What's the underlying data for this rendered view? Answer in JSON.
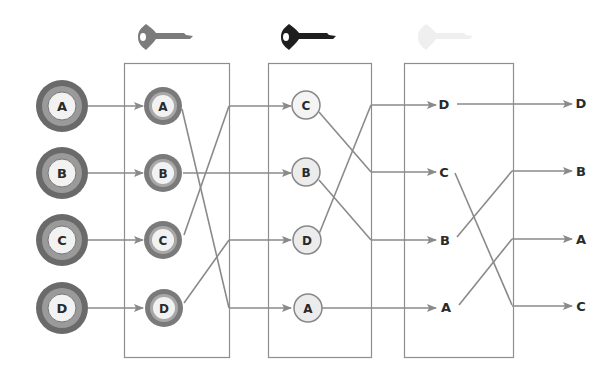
{
  "diagram": {
    "colors": {
      "line": "#8a8a8a",
      "box": "#8e8e8e",
      "outer_ring": "#6a6a6a",
      "mid_ring": "#9a9a9a",
      "inner_fill": "#f2f2f2",
      "key1": "#7b7b7b",
      "key2": "#1e1e1e",
      "key3": "#ececec",
      "text": "#2a2a2a"
    },
    "keys": [
      {
        "name": "key-1",
        "icon": "key-icon",
        "shade": "gray"
      },
      {
        "name": "key-2",
        "icon": "key-icon",
        "shade": "black"
      },
      {
        "name": "key-3",
        "icon": "key-icon",
        "shade": "faded"
      }
    ],
    "inputs": [
      "A",
      "B",
      "C",
      "D"
    ],
    "stages": [
      {
        "name": "stage-1",
        "nodes_in": [
          "A",
          "B",
          "C",
          "D"
        ],
        "outputs": [
          "C",
          "B",
          "D",
          "A"
        ]
      },
      {
        "name": "stage-2",
        "nodes_in": [
          "C",
          "B",
          "D",
          "A"
        ],
        "outputs": [
          "D",
          "C",
          "B",
          "A"
        ]
      },
      {
        "name": "stage-3",
        "nodes_in": [
          "D",
          "C",
          "B",
          "A"
        ],
        "outputs": [
          "D",
          "B",
          "A",
          "C"
        ]
      }
    ],
    "final_outputs": [
      "D",
      "B",
      "A",
      "C"
    ]
  }
}
